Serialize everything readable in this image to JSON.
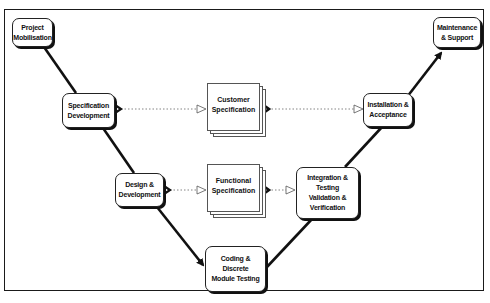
{
  "diagram": {
    "type": "V-model lifecycle",
    "colors": {
      "line": "#111111",
      "box_border": "#222222",
      "dotted": "#777777",
      "background": "#ffffff"
    },
    "nodes": {
      "project_mobilisation": {
        "lines": [
          "Project",
          "Mobilisation"
        ]
      },
      "specification_development": {
        "lines": [
          "Specification",
          "Development"
        ]
      },
      "design_development": {
        "lines": [
          "Design &",
          "Development"
        ]
      },
      "coding_testing": {
        "lines": [
          "Coding &",
          "Discrete",
          "Module Testing"
        ]
      },
      "integration_testing": {
        "lines": [
          "Integration &",
          "Testing",
          "Validation &",
          "Verification"
        ]
      },
      "installation_acceptance": {
        "lines": [
          "Installation &",
          "Acceptance"
        ]
      },
      "maintenance_support": {
        "lines": [
          "Maintenance",
          "& Support"
        ]
      }
    },
    "documents": {
      "customer_specification": {
        "lines": [
          "Customer",
          "Specification"
        ]
      },
      "functional_specification": {
        "lines": [
          "Functional",
          "Specification"
        ]
      }
    },
    "edges": [
      {
        "from": "Project Mobilisation",
        "to": "Specification Development",
        "style": "solid"
      },
      {
        "from": "Specification Development",
        "to": "Design & Development",
        "style": "solid"
      },
      {
        "from": "Design & Development",
        "to": "Coding & Discrete Module Testing",
        "style": "solid-arrow"
      },
      {
        "from": "Coding & Discrete Module Testing",
        "to": "Integration & Testing Validation & Verification",
        "style": "solid"
      },
      {
        "from": "Integration & Testing Validation & Verification",
        "to": "Installation & Acceptance",
        "style": "solid"
      },
      {
        "from": "Installation & Acceptance",
        "to": "Maintenance & Support",
        "style": "solid-arrow"
      },
      {
        "from": "Specification Development",
        "to": "Customer Specification",
        "style": "dotted"
      },
      {
        "from": "Customer Specification",
        "to": "Installation & Acceptance",
        "style": "dotted"
      },
      {
        "from": "Design & Development",
        "to": "Functional Specification",
        "style": "dotted"
      },
      {
        "from": "Functional Specification",
        "to": "Integration & Testing Validation & Verification",
        "style": "dotted"
      }
    ]
  }
}
